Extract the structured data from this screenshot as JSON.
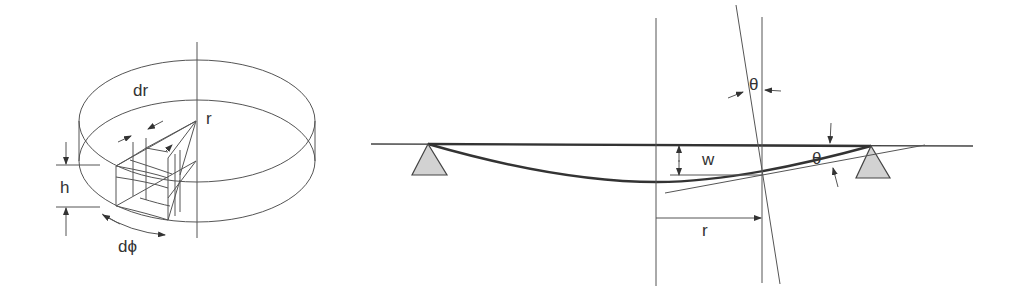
{
  "figure": {
    "left_panel": {
      "description": "cylindrical plate element",
      "labels": {
        "dr": "dr",
        "r": "r",
        "h": "h",
        "dphi": "dϕ"
      }
    },
    "right_panel": {
      "description": "simply supported plate deflection cross-section",
      "labels": {
        "theta_top": "θ",
        "theta_right": "θ",
        "w": "w",
        "r": "r"
      }
    },
    "colors": {
      "line": "#444444",
      "support_fill": "#d2d2d2",
      "background": "#ffffff"
    }
  }
}
